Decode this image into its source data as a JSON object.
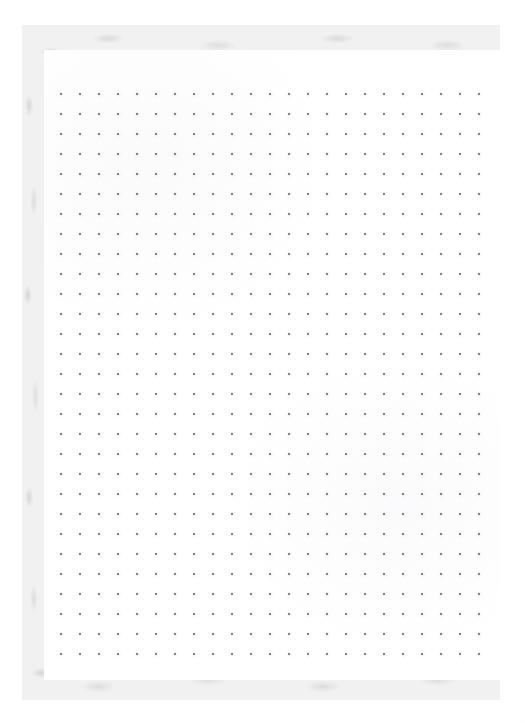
{
  "document": {
    "kind": "scanned-dot-grid-notebook-page",
    "canvas": {
      "width": 525,
      "height": 723
    },
    "background_color": "#ffffff"
  },
  "paper": {
    "frame": {
      "name": "textured-paper-edge",
      "x": 22,
      "y": 25,
      "width": 478,
      "height": 675,
      "base_color": "#f1f1f2",
      "noise_color": "#d4d4d7"
    },
    "surface": {
      "name": "inner-page",
      "x": 44,
      "y": 50,
      "width": 456,
      "height": 630,
      "color": "#ffffff"
    }
  },
  "grid": {
    "name": "dot-grid",
    "dot_color": "#58585c",
    "dot_size_px": 2,
    "columns": 23,
    "rows": 29,
    "spacing_x_px": 19,
    "spacing_y_px": 20,
    "origin_x_px": 16,
    "origin_y_px": 43
  },
  "content": {
    "text_items": [],
    "note": ""
  }
}
